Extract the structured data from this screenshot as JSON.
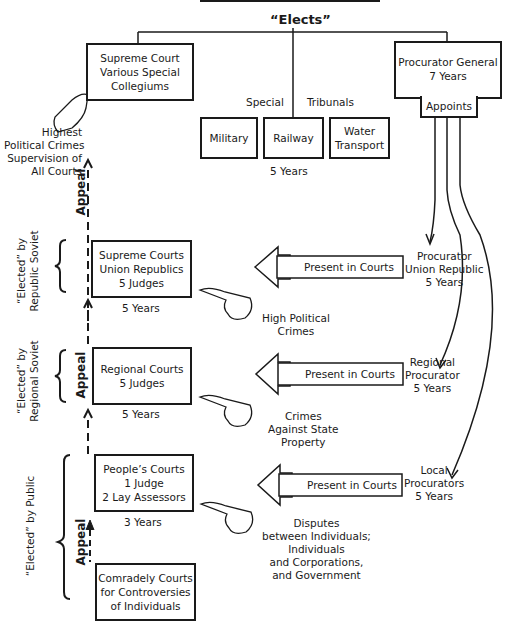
{
  "header": {
    "elects_label": "“Elects”"
  },
  "supreme_court": {
    "lines": [
      "Supreme Court",
      "Various Special",
      "Collegiums"
    ]
  },
  "procurator_general": {
    "lines": [
      "Procurator General",
      "7 Years"
    ],
    "appoints_label": "Appoints"
  },
  "special_tribunals": {
    "label_left": "Special",
    "label_right": "Tribunals",
    "items": [
      "Military",
      "Railway",
      "Water Transport"
    ],
    "term": "5 Years"
  },
  "highest_note": {
    "lines": [
      "Highest",
      "Political Crimes",
      "Supervision of",
      "All Courts"
    ]
  },
  "levels": [
    {
      "court_lines": [
        "Supreme Courts",
        "Union Republics",
        "5 Judges"
      ],
      "term": "5 Years",
      "elected_by": "“Elected” by Republic Soviet",
      "elected_line1": "“Elected” by",
      "elected_line2": "Republic Soviet",
      "jurisdiction": [
        "High Political",
        "Crimes"
      ],
      "present_label": "Present in Courts",
      "procurator": [
        "Procurator",
        "Union Republic",
        "5 Years"
      ]
    },
    {
      "court_lines": [
        "Regional Courts",
        "5 Judges"
      ],
      "term": "5 Years",
      "elected_line1": "“Elected” by",
      "elected_line2": "Regional Soviet",
      "jurisdiction": [
        "Crimes",
        "Against State",
        "Property"
      ],
      "present_label": "Present in Courts",
      "procurator": [
        "Regional",
        "Procurator",
        "5 Years"
      ]
    },
    {
      "court_lines": [
        "People’s Courts",
        "1 Judge",
        "2 Lay Assessors"
      ],
      "term": "3 Years",
      "elected_line1": "“Elected” by Public",
      "jurisdiction": [
        "Disputes",
        "between Individuals;",
        "Individuals",
        "and Corporations,",
        "and Government"
      ],
      "present_label": "Present in Courts",
      "procurator": [
        "Local",
        "Procurators",
        "5 Years"
      ]
    }
  ],
  "comradely_courts": {
    "lines": [
      "Comradely Courts",
      "for Controversies",
      "of Individuals"
    ]
  },
  "appeal_label": "Appeal"
}
